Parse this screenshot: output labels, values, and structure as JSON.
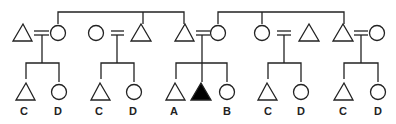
{
  "diagram": {
    "type": "kinship-chart",
    "ego_color": "#000000",
    "line_color": "#222222",
    "top_sibling_groups": [
      {
        "name": "left-sibling-set",
        "members": [
          "female-1",
          "male-2",
          "male-3"
        ]
      },
      {
        "name": "right-sibling-set",
        "members": [
          "female-3",
          "female-4",
          "male-5"
        ]
      }
    ],
    "couples": [
      {
        "id": "couple-1",
        "left": "male",
        "right": "female",
        "married": true,
        "children_labels": [
          "C",
          "D"
        ]
      },
      {
        "id": "couple-2",
        "left": "female",
        "right": "male",
        "married": true,
        "children_labels": [
          "C",
          "D"
        ]
      },
      {
        "id": "couple-3",
        "left": "male",
        "right": "female",
        "married": true,
        "children_labels": [
          "A",
          "",
          "B"
        ],
        "ego_index": 1
      },
      {
        "id": "couple-4",
        "left": "female",
        "right": "male",
        "married": true,
        "children_labels": [
          "C",
          "D"
        ]
      },
      {
        "id": "couple-5",
        "left": "male",
        "right": "female",
        "married": true,
        "children_labels": [
          "C",
          "D"
        ]
      }
    ],
    "labels": {
      "c1_child1": "C",
      "c1_child2": "D",
      "c2_child1": "C",
      "c2_child2": "D",
      "c3_child1": "A",
      "c3_child3": "B",
      "c4_child1": "C",
      "c4_child2": "D",
      "c5_child1": "C",
      "c5_child2": "D"
    }
  }
}
